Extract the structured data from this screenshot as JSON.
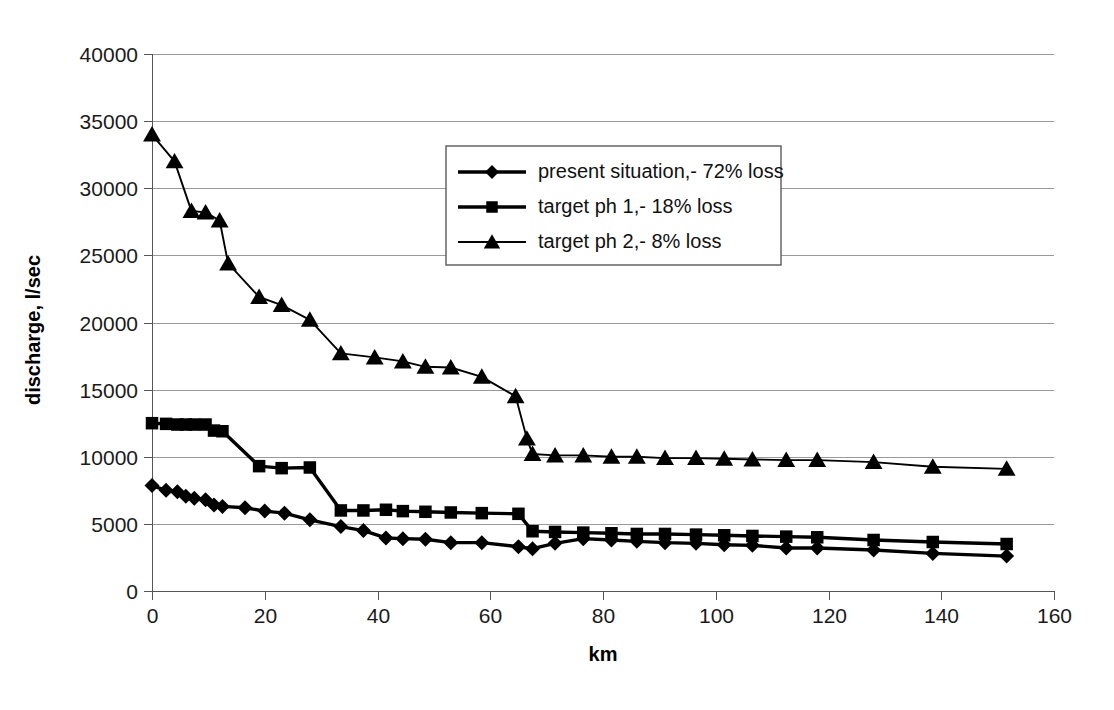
{
  "chart_data": {
    "type": "line",
    "title": "",
    "xlabel": "km",
    "ylabel": "discharge, l/sec",
    "xlim": [
      0,
      160
    ],
    "ylim": [
      0,
      40000
    ],
    "xticks": [
      0,
      20,
      40,
      60,
      80,
      100,
      120,
      140,
      160
    ],
    "yticks": [
      0,
      5000,
      10000,
      15000,
      20000,
      25000,
      30000,
      35000,
      40000
    ],
    "xtick_labels": [
      "0",
      "20",
      "40",
      "60",
      "80",
      "100",
      "120",
      "140",
      "160"
    ],
    "ytick_labels": [
      "0",
      "5000",
      "10000",
      "15000",
      "20000",
      "25000",
      "30000",
      "35000",
      "40000"
    ],
    "grid": "horizontal",
    "legend_position": "upper-center",
    "series": [
      {
        "name": "present situation,- 72% loss",
        "marker": "diamond",
        "line_width": "thick",
        "x": [
          0,
          2.5,
          4.5,
          6,
          7.5,
          9.5,
          11,
          12.5,
          16.5,
          20,
          23.5,
          28,
          33.5,
          37.5,
          41.5,
          44.5,
          48.5,
          53,
          58.5,
          65,
          67.5,
          71.5,
          76.5,
          81.5,
          86,
          91,
          96.5,
          101.5,
          106.5,
          112.5,
          118,
          128,
          138.5,
          151.6
        ],
        "y": [
          7850,
          7500,
          7400,
          7050,
          6900,
          6800,
          6400,
          6300,
          6200,
          5950,
          5800,
          5300,
          4800,
          4500,
          3950,
          3900,
          3850,
          3600,
          3600,
          3300,
          3150,
          3550,
          3900,
          3800,
          3700,
          3600,
          3550,
          3450,
          3400,
          3200,
          3200,
          3050,
          2800,
          2600
        ]
      },
      {
        "name": "target ph 1,- 18% loss",
        "marker": "square",
        "line_width": "thick",
        "x": [
          0,
          2.5,
          4.5,
          6,
          7.5,
          9.5,
          11,
          12.5,
          19,
          23,
          28,
          33.5,
          37.5,
          41.5,
          44.5,
          48.5,
          53,
          58.5,
          65,
          67.5,
          71.5,
          76.5,
          81.5,
          86,
          91,
          96.5,
          101.5,
          106.5,
          112.5,
          118,
          128,
          138.5,
          151.6
        ],
        "y": [
          12500,
          12450,
          12400,
          12400,
          12400,
          12400,
          11950,
          11900,
          9300,
          9150,
          9200,
          6000,
          6000,
          6050,
          5950,
          5900,
          5850,
          5800,
          5750,
          4450,
          4400,
          4350,
          4300,
          4250,
          4250,
          4200,
          4150,
          4100,
          4050,
          4000,
          3800,
          3650,
          3500
        ]
      },
      {
        "name": "target ph 2,- 8% loss",
        "marker": "triangle",
        "line_width": "thin",
        "x": [
          0,
          4,
          7,
          9.5,
          12,
          13.5,
          19,
          23,
          28,
          33.5,
          39.5,
          44.5,
          48.5,
          53,
          58.5,
          64.5,
          66.5,
          67.5,
          71.5,
          76.5,
          81.5,
          86,
          91,
          96.5,
          101.5,
          106.5,
          112.5,
          118,
          128,
          138.5,
          151.6
        ],
        "y": [
          34000,
          32000,
          28300,
          28200,
          27600,
          24400,
          21900,
          21300,
          20200,
          17700,
          17400,
          17100,
          16700,
          16650,
          15950,
          14500,
          11350,
          10200,
          10100,
          10100,
          10000,
          10000,
          9900,
          9900,
          9850,
          9800,
          9750,
          9750,
          9600,
          9250,
          9100
        ]
      }
    ]
  },
  "axes": {
    "x_title": "km",
    "y_title": "discharge, l/sec"
  },
  "legend": {
    "items": [
      {
        "label": "present situation,- 72% loss",
        "marker": "diamond"
      },
      {
        "label": "target ph 1,- 18% loss",
        "marker": "square"
      },
      {
        "label": "target ph 2,- 8% loss",
        "marker": "triangle"
      }
    ]
  }
}
